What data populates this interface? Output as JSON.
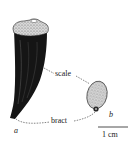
{
  "figure": {
    "labels": {
      "scale": "scale",
      "bract": "bract",
      "part_a": "a",
      "part_b": "b",
      "scale_bar": "1 cm"
    },
    "colors": {
      "ink": "#1a1a1a",
      "stipple": "#9a9a9a",
      "background": "#ffffff"
    }
  }
}
